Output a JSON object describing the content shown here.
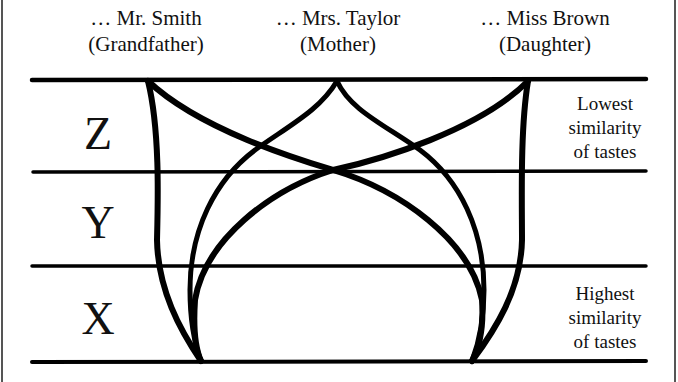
{
  "people": [
    {
      "name": "… Mr. Smith",
      "role": "(Grandfather)"
    },
    {
      "name": "… Mrs. Taylor",
      "role": "(Mother)"
    },
    {
      "name": "… Miss Brown",
      "role": "(Daughter)"
    }
  ],
  "levels": [
    {
      "label": "Z"
    },
    {
      "label": "Y"
    },
    {
      "label": "X"
    }
  ],
  "notes": {
    "top": [
      "Lowest",
      "similarity",
      "of tastes"
    ],
    "bottom": [
      "Highest",
      "similarity",
      "of tastes"
    ]
  },
  "colors": {
    "line": "#000000",
    "background": "#ffffff"
  }
}
